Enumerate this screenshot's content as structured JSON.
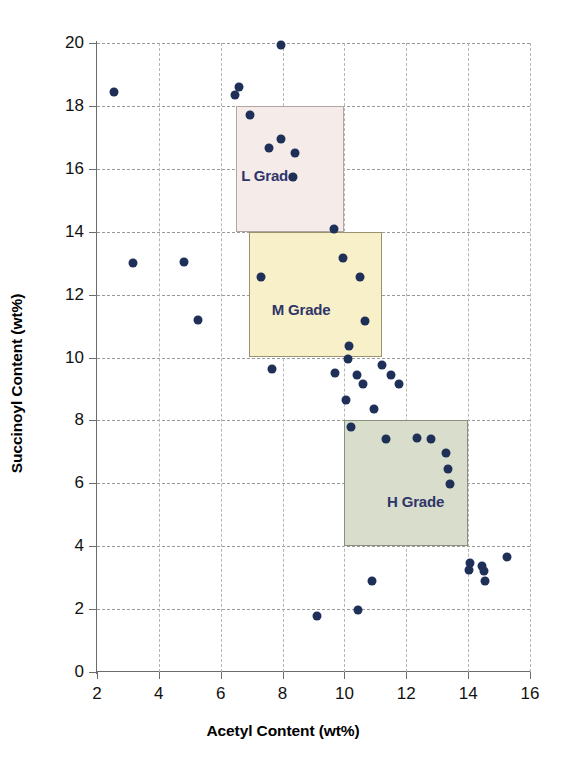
{
  "chart_data": {
    "type": "scatter",
    "title": "",
    "xlabel": "Acetyl Content (wt%)",
    "ylabel": "Succinoyl Content (wt%)",
    "xlim": [
      2,
      16
    ],
    "ylim": [
      0,
      20
    ],
    "xticks": [
      2,
      4,
      6,
      8,
      10,
      12,
      14,
      16
    ],
    "yticks": [
      0,
      2,
      4,
      6,
      8,
      10,
      12,
      14,
      16,
      18,
      20
    ],
    "grid": true,
    "legend": "none",
    "marker_color": "#1f3058",
    "points": [
      {
        "x": 2.55,
        "y": 18.45
      },
      {
        "x": 3.15,
        "y": 13.0
      },
      {
        "x": 4.8,
        "y": 13.05
      },
      {
        "x": 5.25,
        "y": 11.2
      },
      {
        "x": 6.45,
        "y": 18.35
      },
      {
        "x": 6.6,
        "y": 18.6
      },
      {
        "x": 6.95,
        "y": 17.7
      },
      {
        "x": 7.3,
        "y": 12.55
      },
      {
        "x": 7.55,
        "y": 16.65
      },
      {
        "x": 7.65,
        "y": 9.65
      },
      {
        "x": 7.95,
        "y": 19.95
      },
      {
        "x": 7.95,
        "y": 16.95
      },
      {
        "x": 8.4,
        "y": 16.5
      },
      {
        "x": 8.35,
        "y": 15.75
      },
      {
        "x": 9.1,
        "y": 1.78
      },
      {
        "x": 9.65,
        "y": 14.1
      },
      {
        "x": 9.7,
        "y": 9.5
      },
      {
        "x": 9.95,
        "y": 13.15
      },
      {
        "x": 10.05,
        "y": 8.65
      },
      {
        "x": 10.1,
        "y": 9.95
      },
      {
        "x": 10.15,
        "y": 10.35
      },
      {
        "x": 10.2,
        "y": 7.8
      },
      {
        "x": 10.4,
        "y": 9.45
      },
      {
        "x": 10.45,
        "y": 1.97
      },
      {
        "x": 10.5,
        "y": 12.55
      },
      {
        "x": 10.6,
        "y": 9.15
      },
      {
        "x": 10.65,
        "y": 11.15
      },
      {
        "x": 10.9,
        "y": 2.88
      },
      {
        "x": 10.95,
        "y": 8.35
      },
      {
        "x": 11.2,
        "y": 9.75
      },
      {
        "x": 11.35,
        "y": 7.4
      },
      {
        "x": 11.5,
        "y": 9.45
      },
      {
        "x": 11.75,
        "y": 9.15
      },
      {
        "x": 12.35,
        "y": 7.45
      },
      {
        "x": 12.8,
        "y": 7.4
      },
      {
        "x": 13.3,
        "y": 6.95
      },
      {
        "x": 13.35,
        "y": 6.45
      },
      {
        "x": 13.4,
        "y": 5.98
      },
      {
        "x": 14.05,
        "y": 3.45
      },
      {
        "x": 14.02,
        "y": 3.25
      },
      {
        "x": 14.45,
        "y": 3.38
      },
      {
        "x": 14.5,
        "y": 3.2
      },
      {
        "x": 14.55,
        "y": 2.9
      },
      {
        "x": 15.25,
        "y": 3.65
      }
    ],
    "bands": [
      {
        "label": "L Grade",
        "x0": 6.5,
        "x1": 10.0,
        "y0": 14.0,
        "y1": 18.0,
        "fill": "#f5ecea",
        "stroke": "#b0a7a5",
        "label_x": 7.55,
        "label_y": 15.8
      },
      {
        "label": "M Grade",
        "x0": 6.9,
        "x1": 11.2,
        "y0": 10.0,
        "y1": 14.0,
        "fill": "#f7f0c9",
        "stroke": "#9b9271",
        "label_x": 8.6,
        "label_y": 11.55
      },
      {
        "label": "H Grade",
        "x0": 10.0,
        "x1": 14.0,
        "y0": 4.0,
        "y1": 8.0,
        "fill": "#d9ddcb",
        "stroke": "#8c8f7e",
        "label_x": 12.3,
        "label_y": 5.45
      }
    ]
  },
  "axes": {
    "x_title": "Acetyl Content (wt%)",
    "y_title": "Succinoyl Content (wt%)",
    "x_tick_labels": [
      "2",
      "4",
      "6",
      "8",
      "10",
      "12",
      "14",
      "16"
    ],
    "y_tick_labels": [
      "0",
      "2",
      "4",
      "6",
      "8",
      "10",
      "12",
      "14",
      "16",
      "18",
      "20"
    ]
  }
}
